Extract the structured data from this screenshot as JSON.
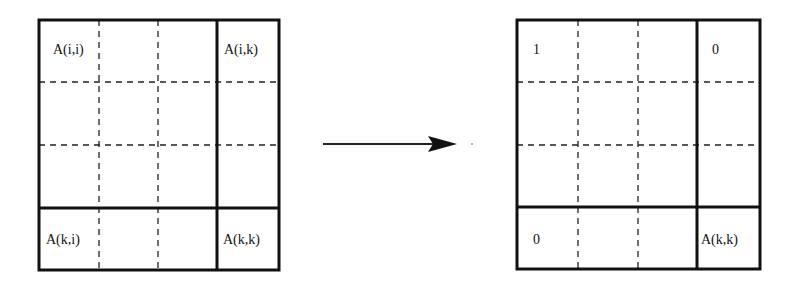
{
  "diagram": {
    "type": "matrix-transformation",
    "left_matrix": {
      "labels": {
        "top_left": "A(i,i)",
        "top_right": "A(i,k)",
        "bottom_left": "A(k,i)",
        "bottom_right": "A(k,k)"
      }
    },
    "arrow": {
      "direction": "right"
    },
    "right_matrix": {
      "labels": {
        "top_left": "1",
        "top_right": "0",
        "bottom_left": "0",
        "bottom_right": "A(k,k)"
      }
    }
  }
}
